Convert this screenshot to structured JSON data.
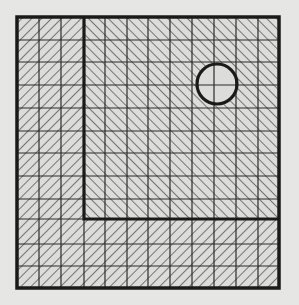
{
  "figure": {
    "colors": {
      "background": "#e6e6e4",
      "fill": "#dcdcda",
      "line": "#1a1a1a",
      "grid": "#2a2a2a",
      "hatch": "#3a3a3a"
    },
    "outer_square": {
      "x": 17,
      "y": 17,
      "width": 262,
      "height": 271
    },
    "grid": {
      "columns": 12,
      "rows": 12,
      "vertical_lines_x": [
        39,
        61,
        84,
        105,
        127,
        148,
        170,
        192,
        214,
        236,
        258
      ],
      "horizontal_lines_y": [
        40,
        62,
        85,
        108,
        131,
        153,
        176,
        199,
        219,
        244,
        266
      ]
    },
    "outer_region": {
      "hatch_direction": "backslash",
      "label": "outer L-shaped region"
    },
    "inner_region": {
      "label": "inner rectangle",
      "hatch_direction": "slash",
      "x": 84,
      "y": 17,
      "width": 195,
      "height": 202
    },
    "circle": {
      "cx": 217,
      "cy": 84,
      "r": 20,
      "fill": "unhatched"
    }
  }
}
